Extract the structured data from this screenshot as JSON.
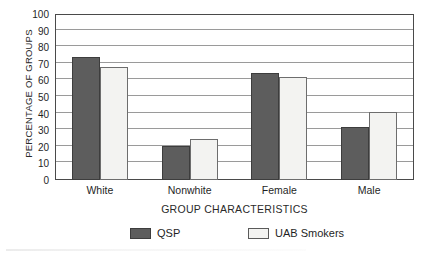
{
  "chart_data": {
    "type": "bar",
    "title": "",
    "xlabel": "GROUP CHARACTERISTICS",
    "ylabel": "PERCENTAGE OF GROUPS",
    "categories": [
      "White",
      "Nonwhite",
      "Female",
      "Male"
    ],
    "series": [
      {
        "name": "QSP",
        "color": "#5d5d5d",
        "values": [
          74,
          20.5,
          64.5,
          32
        ]
      },
      {
        "name": "UAB Smokers",
        "color": "#f3f3f1",
        "values": [
          68,
          24.5,
          62,
          41
        ]
      }
    ],
    "ylim": [
      0,
      100
    ],
    "yticks": [
      0,
      10,
      20,
      30,
      40,
      50,
      60,
      70,
      80,
      90,
      100
    ],
    "ytick_labels": [
      "0",
      "10",
      "20",
      "30",
      "40",
      "50",
      "60",
      "70",
      "80",
      "90",
      "100"
    ],
    "grid": true,
    "legend_position": "bottom-center"
  },
  "legend": {
    "items": [
      {
        "label": "QSP",
        "swatch": "dark-gray-filled-square"
      },
      {
        "label": "UAB Smokers",
        "swatch": "white-outlined-square"
      }
    ]
  }
}
